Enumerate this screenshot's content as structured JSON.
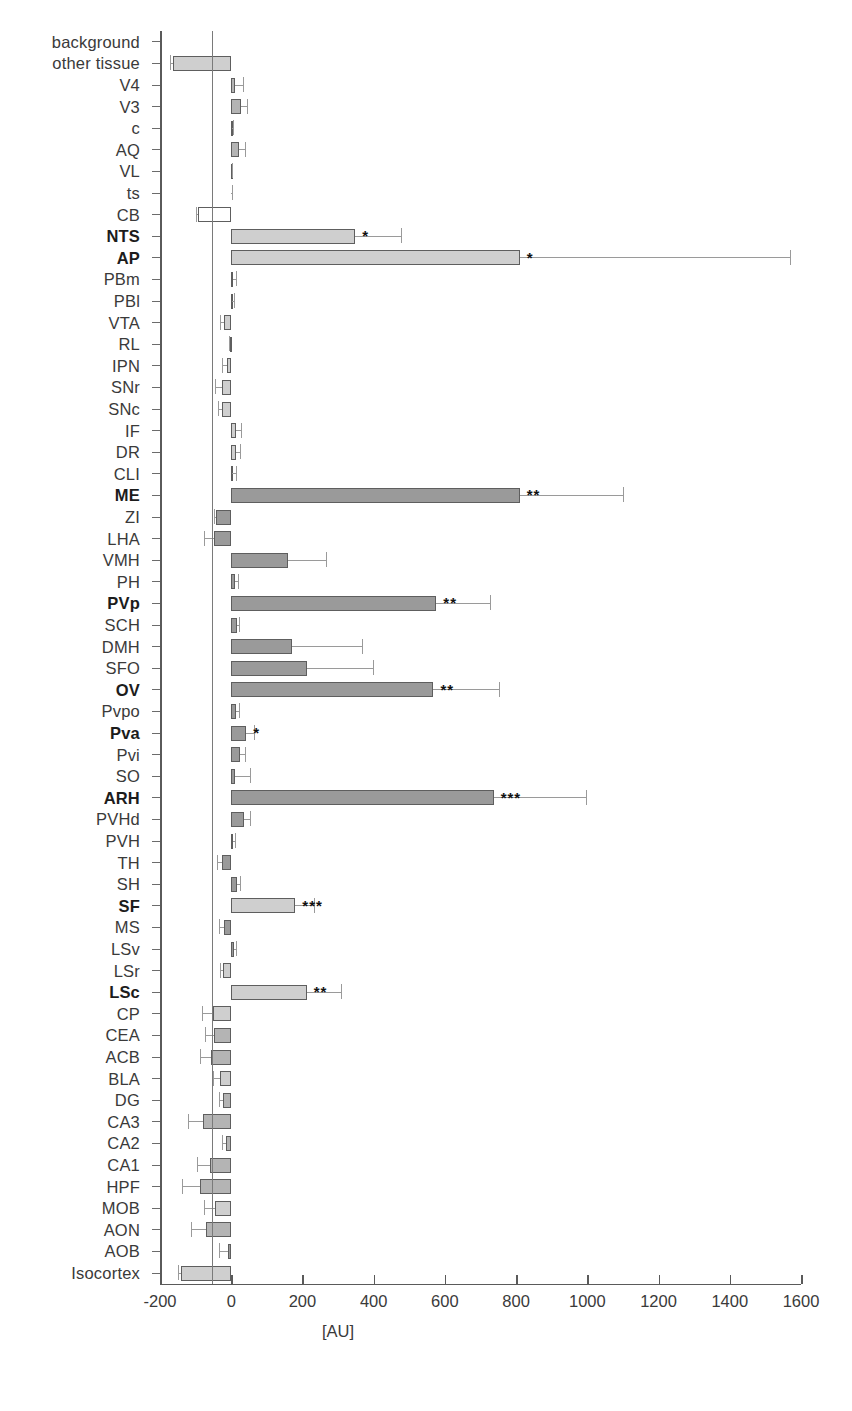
{
  "chart_data": {
    "type": "bar",
    "orientation": "horizontal",
    "title": "",
    "xlabel": "[AU]",
    "ylabel": "",
    "xlim": [
      -200,
      1600
    ],
    "xticks": [
      -200,
      0,
      200,
      400,
      600,
      800,
      1000,
      1200,
      1400,
      1600
    ],
    "xtick_labels": [
      "-200",
      "0",
      "200",
      "400",
      "600",
      "800",
      "1000",
      "1200",
      "1400",
      "1600"
    ],
    "grid": false,
    "legend": null,
    "significance_levels": [
      "*",
      "**",
      "***"
    ],
    "categories": [
      "background",
      "other tissue",
      "V4",
      "V3",
      "c",
      "AQ",
      "VL",
      "ts",
      "CB",
      "NTS",
      "AP",
      "PBm",
      "PBl",
      "VTA",
      "RL",
      "IPN",
      "SNr",
      "SNc",
      "IF",
      "DR",
      "CLI",
      "ME",
      "ZI",
      "LHA",
      "VMH",
      "PH",
      "PVp",
      "SCH",
      "DMH",
      "SFO",
      "OV",
      "Pvpo",
      "Pva",
      "Pvi",
      "SO",
      "ARH",
      "PVHd",
      "PVH",
      "TH",
      "SH",
      "SF",
      "MS",
      "LSv",
      "LSr",
      "LSc",
      "CP",
      "CEA",
      "ACB",
      "BLA",
      "DG",
      "CA3",
      "CA2",
      "CA1",
      "HPF",
      "MOB",
      "AON",
      "AOB",
      "Isocortex"
    ],
    "bars": [
      {
        "label": "background",
        "value": 0,
        "error": 0,
        "sig": "",
        "bold": false,
        "shade": "none"
      },
      {
        "label": "other tissue",
        "value": -163,
        "error": 8,
        "sig": "",
        "bold": false,
        "shade": "light"
      },
      {
        "label": "V4",
        "value": 12,
        "error": 22,
        "sig": "",
        "bold": false,
        "shade": "mid"
      },
      {
        "label": "V3",
        "value": 27,
        "error": 18,
        "sig": "",
        "bold": false,
        "shade": "mid"
      },
      {
        "label": "c",
        "value": 2,
        "error": 3,
        "sig": "",
        "bold": false,
        "shade": "mid"
      },
      {
        "label": "AQ",
        "value": 22,
        "error": 17,
        "sig": "",
        "bold": false,
        "shade": "mid"
      },
      {
        "label": "VL",
        "value": 1,
        "error": 2,
        "sig": "",
        "bold": false,
        "shade": "mid"
      },
      {
        "label": "ts",
        "value": 0,
        "error": 2,
        "sig": "",
        "bold": false,
        "shade": "mid"
      },
      {
        "label": "CB",
        "value": -92,
        "error": 6,
        "sig": "",
        "bold": false,
        "shade": "white"
      },
      {
        "label": "NTS",
        "value": 348,
        "error": 130,
        "sig": "*",
        "bold": true,
        "shade": "light"
      },
      {
        "label": "AP",
        "value": 810,
        "error": 760,
        "sig": "*",
        "bold": true,
        "shade": "light"
      },
      {
        "label": "PBm",
        "value": 5,
        "error": 9,
        "sig": "",
        "bold": false,
        "shade": "mid"
      },
      {
        "label": "PBl",
        "value": 2,
        "error": 6,
        "sig": "",
        "bold": false,
        "shade": "mid"
      },
      {
        "label": "VTA",
        "value": -20,
        "error": 11,
        "sig": "",
        "bold": false,
        "shade": "light"
      },
      {
        "label": "RL",
        "value": -3,
        "error": 4,
        "sig": "",
        "bold": false,
        "shade": "mid"
      },
      {
        "label": "IPN",
        "value": -13,
        "error": 14,
        "sig": "",
        "bold": false,
        "shade": "light"
      },
      {
        "label": "SNr",
        "value": -25,
        "error": 20,
        "sig": "",
        "bold": false,
        "shade": "light"
      },
      {
        "label": "SNc",
        "value": -26,
        "error": 12,
        "sig": "",
        "bold": false,
        "shade": "light"
      },
      {
        "label": "IF",
        "value": 14,
        "error": 13,
        "sig": "",
        "bold": false,
        "shade": "light"
      },
      {
        "label": "DR",
        "value": 14,
        "error": 12,
        "sig": "",
        "bold": false,
        "shade": "light"
      },
      {
        "label": "CLI",
        "value": 3,
        "error": 11,
        "sig": "",
        "bold": false,
        "shade": "mid"
      },
      {
        "label": "ME",
        "value": 810,
        "error": 290,
        "sig": "**",
        "bold": true,
        "shade": "dark"
      },
      {
        "label": "ZI",
        "value": -42,
        "error": 5,
        "sig": "",
        "bold": false,
        "shade": "dark"
      },
      {
        "label": "LHA",
        "value": -47,
        "error": 30,
        "sig": "",
        "bold": false,
        "shade": "dark"
      },
      {
        "label": "VMH",
        "value": 160,
        "error": 105,
        "sig": "",
        "bold": false,
        "shade": "dark"
      },
      {
        "label": "PH",
        "value": 11,
        "error": 7,
        "sig": "",
        "bold": false,
        "shade": "dark"
      },
      {
        "label": "PVp",
        "value": 576,
        "error": 150,
        "sig": "**",
        "bold": true,
        "shade": "dark"
      },
      {
        "label": "SCH",
        "value": 16,
        "error": 7,
        "sig": "",
        "bold": false,
        "shade": "dark"
      },
      {
        "label": "DMH",
        "value": 171,
        "error": 195,
        "sig": "",
        "bold": false,
        "shade": "dark"
      },
      {
        "label": "SFO",
        "value": 212,
        "error": 185,
        "sig": "",
        "bold": false,
        "shade": "dark"
      },
      {
        "label": "OV",
        "value": 568,
        "error": 185,
        "sig": "**",
        "bold": true,
        "shade": "dark"
      },
      {
        "label": "Pvpo",
        "value": 13,
        "error": 9,
        "sig": "",
        "bold": false,
        "shade": "dark"
      },
      {
        "label": "Pva",
        "value": 42,
        "error": 22,
        "sig": "*",
        "bold": true,
        "shade": "dark"
      },
      {
        "label": "Pvi",
        "value": 26,
        "error": 13,
        "sig": "",
        "bold": false,
        "shade": "dark"
      },
      {
        "label": "SO",
        "value": 10,
        "error": 42,
        "sig": "",
        "bold": false,
        "shade": "dark"
      },
      {
        "label": "ARH",
        "value": 737,
        "error": 258,
        "sig": "***",
        "bold": true,
        "shade": "dark"
      },
      {
        "label": "PVHd",
        "value": 36,
        "error": 18,
        "sig": "",
        "bold": false,
        "shade": "dark"
      },
      {
        "label": "PVH",
        "value": 4,
        "error": 6,
        "sig": "",
        "bold": false,
        "shade": "dark"
      },
      {
        "label": "TH",
        "value": -25,
        "error": 14,
        "sig": "",
        "bold": false,
        "shade": "dark"
      },
      {
        "label": "SH",
        "value": 16,
        "error": 10,
        "sig": "",
        "bold": false,
        "shade": "dark"
      },
      {
        "label": "SF",
        "value": 180,
        "error": 52,
        "sig": "***",
        "bold": true,
        "shade": "light"
      },
      {
        "label": "MS",
        "value": -20,
        "error": 15,
        "sig": "",
        "bold": false,
        "shade": "dark"
      },
      {
        "label": "LSv",
        "value": 8,
        "error": 6,
        "sig": "",
        "bold": false,
        "shade": "dark"
      },
      {
        "label": "LSr",
        "value": -22,
        "error": 10,
        "sig": "",
        "bold": false,
        "shade": "light"
      },
      {
        "label": "LSc",
        "value": 212,
        "error": 95,
        "sig": "**",
        "bold": true,
        "shade": "light"
      },
      {
        "label": "CP",
        "value": -51,
        "error": 30,
        "sig": "",
        "bold": false,
        "shade": "light"
      },
      {
        "label": "CEA",
        "value": -48,
        "error": 26,
        "sig": "",
        "bold": false,
        "shade": "mid"
      },
      {
        "label": "ACB",
        "value": -57,
        "error": 32,
        "sig": "",
        "bold": false,
        "shade": "mid"
      },
      {
        "label": "BLA",
        "value": -31,
        "error": 20,
        "sig": "",
        "bold": false,
        "shade": "light"
      },
      {
        "label": "DG",
        "value": -22,
        "error": 12,
        "sig": "",
        "bold": false,
        "shade": "mid"
      },
      {
        "label": "CA3",
        "value": -78,
        "error": 42,
        "sig": "",
        "bold": false,
        "shade": "mid"
      },
      {
        "label": "CA2",
        "value": -16,
        "error": 10,
        "sig": "",
        "bold": false,
        "shade": "mid"
      },
      {
        "label": "CA1",
        "value": -60,
        "error": 35,
        "sig": "",
        "bold": false,
        "shade": "mid"
      },
      {
        "label": "HPF",
        "value": -88,
        "error": 50,
        "sig": "",
        "bold": false,
        "shade": "mid"
      },
      {
        "label": "MOB",
        "value": -46,
        "error": 30,
        "sig": "",
        "bold": false,
        "shade": "light"
      },
      {
        "label": "AON",
        "value": -70,
        "error": 42,
        "sig": "",
        "bold": false,
        "shade": "mid"
      },
      {
        "label": "AOB",
        "value": -8,
        "error": 25,
        "sig": "",
        "bold": false,
        "shade": "dark"
      },
      {
        "label": "Isocortex",
        "value": -141,
        "error": 8,
        "sig": "",
        "bold": false,
        "shade": "light"
      }
    ]
  },
  "colors": {
    "bar_light": "#cfcfcf",
    "bar_mid": "#b4b4b4",
    "bar_dark": "#9a9a9a",
    "bar_white": "#ffffff",
    "bar_edge": "#5e5e5e",
    "error": "#9a9a9a",
    "axis": "#5a5a5a",
    "text": "#3a3a3a"
  }
}
